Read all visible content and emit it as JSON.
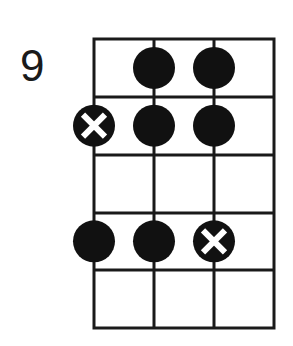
{
  "diagram": {
    "type": "fretboard-scale-diagram",
    "fret_label": "9",
    "strings": 4,
    "frets_shown": 5,
    "grid": {
      "left": 94,
      "top": 39,
      "col_spacing": 60,
      "row_spacing": 57.8,
      "line_color": "#1a1a1a"
    },
    "dots": [
      {
        "string": 2,
        "fret_row": 1,
        "marker": "filled"
      },
      {
        "string": 3,
        "fret_row": 1,
        "marker": "filled"
      },
      {
        "string": 1,
        "fret_row": 2,
        "marker": "root-x"
      },
      {
        "string": 2,
        "fret_row": 2,
        "marker": "filled"
      },
      {
        "string": 3,
        "fret_row": 2,
        "marker": "filled"
      },
      {
        "string": 1,
        "fret_row": 4,
        "marker": "filled"
      },
      {
        "string": 2,
        "fret_row": 4,
        "marker": "filled"
      },
      {
        "string": 3,
        "fret_row": 4,
        "marker": "root-x"
      }
    ],
    "colors": {
      "dot": "#111111",
      "x_mark": "#ffffff",
      "background": "#ffffff"
    }
  }
}
